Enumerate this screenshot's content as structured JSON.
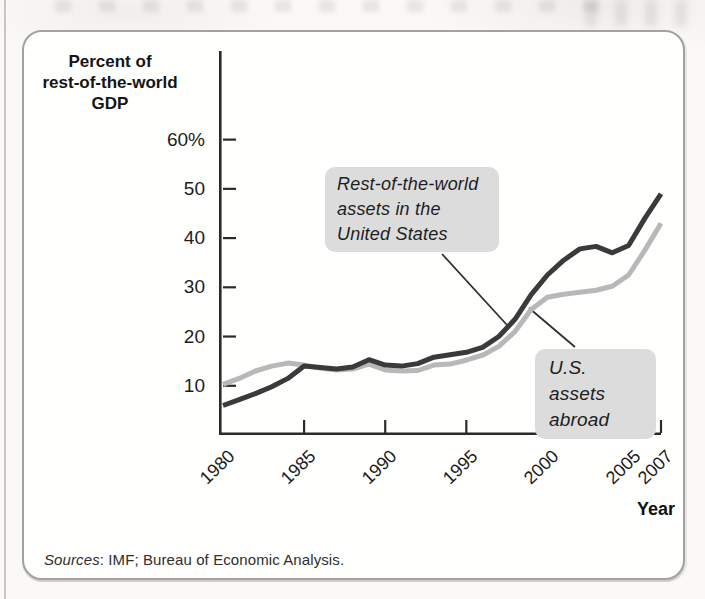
{
  "page": {
    "sources_label": "Sources",
    "sources_rest": ": IMF; Bureau of Economic Analysis."
  },
  "chart_data": {
    "type": "line",
    "title": "",
    "y_axis_title": "Percent of\nrest-of-the-world\nGDP",
    "x_axis_label": "Year",
    "x": [
      1980,
      1981,
      1982,
      1983,
      1984,
      1985,
      1986,
      1987,
      1988,
      1989,
      1990,
      1991,
      1992,
      1993,
      1994,
      1995,
      1996,
      1997,
      1998,
      1999,
      2000,
      2001,
      2002,
      2003,
      2004,
      2005,
      2006,
      2007
    ],
    "series": [
      {
        "name": "Rest-of-the-world assets in the United States",
        "color": "#3a3a3a",
        "values": [
          6.0,
          7.2,
          8.4,
          9.8,
          11.5,
          14.0,
          13.7,
          13.4,
          13.8,
          15.3,
          14.2,
          14.0,
          14.5,
          15.8,
          16.3,
          16.8,
          17.8,
          20.0,
          23.5,
          28.5,
          32.5,
          35.5,
          37.8,
          38.3,
          37.0,
          38.5,
          44.0,
          49.0
        ]
      },
      {
        "name": "U.S. assets abroad",
        "color": "#b8b8b8",
        "values": [
          10.3,
          11.5,
          13.0,
          14.0,
          14.6,
          14.2,
          13.6,
          13.2,
          13.4,
          14.4,
          13.2,
          13.0,
          13.1,
          14.2,
          14.4,
          15.2,
          16.2,
          18.0,
          21.0,
          25.5,
          28.0,
          28.6,
          29.0,
          29.4,
          30.2,
          32.5,
          37.5,
          43.0
        ]
      }
    ],
    "x_ticks": {
      "values": [
        1980,
        1985,
        1990,
        1995,
        2000,
        2005,
        2007
      ],
      "labels": [
        "1980",
        "1985",
        "1990",
        "1995",
        "2000",
        "2005",
        "2007"
      ]
    },
    "y_ticks": {
      "values": [
        60,
        50,
        40,
        30,
        20,
        10
      ],
      "labels": [
        "60%",
        "50",
        "40",
        "30",
        "20",
        "10"
      ]
    },
    "xlim": [
      1980,
      2007
    ],
    "ylim": [
      0,
      78
    ],
    "grid": false,
    "axis_color": "#2b2b2b",
    "annotation_bg": "#dcdcdc",
    "annotations": [
      {
        "text": "Rest-of-the-world\nassets in the\nUnited States",
        "points_to_series": "Rest-of-the-world assets in the United States"
      },
      {
        "text": "U.S. assets\nabroad",
        "points_to_series": "U.S. assets abroad"
      }
    ],
    "sources": "Sources: IMF; Bureau of Economic Analysis."
  }
}
